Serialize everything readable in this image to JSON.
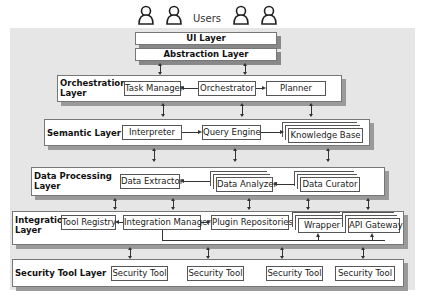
{
  "users": {
    "label": "Users",
    "icon": "user-icon",
    "count": 4
  },
  "top": {
    "ui_layer": "UI Layer",
    "abstraction_layer": "Abstraction Layer"
  },
  "orchestration": {
    "title_line1": "Orchestration",
    "title_line2": "Layer",
    "components": [
      "Task Manager",
      "Orchestrator",
      "Planner"
    ]
  },
  "semantic": {
    "title": "Semantic Layer",
    "components": [
      "Interpreter",
      "Query Engine",
      "Knowledge Base"
    ]
  },
  "data_processing": {
    "title_line1": "Data Processing",
    "title_line2": "Layer",
    "components": [
      "Data Extractor",
      "Data Analyzer",
      "Data Curator"
    ]
  },
  "integration": {
    "title_line1": "Integration",
    "title_line2": "Layer",
    "components": [
      "Tool Registry",
      "Integration Manager",
      "Plugin Repositories",
      "Wrapper",
      "API Gateway"
    ]
  },
  "security": {
    "title": "Security Tool Layer",
    "components": [
      "Security Tool",
      "Security Tool",
      "Security Tool",
      "Security Tool"
    ]
  }
}
